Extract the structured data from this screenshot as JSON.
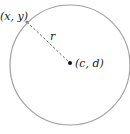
{
  "diagram": {
    "title": "",
    "circle": {
      "center_label": "(c, d)",
      "point_label": "(x, y)",
      "radius_label": "r",
      "stroke_color": "#a0a0a0",
      "dash_color": "#555555",
      "dot_color": "#111111"
    }
  }
}
